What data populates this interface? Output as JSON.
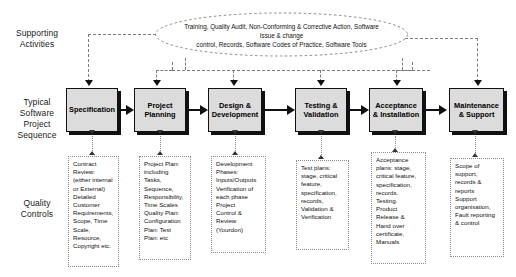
{
  "diagram": {
    "row_labels": [
      {
        "id": "supporting-activities",
        "text": "Supporting\nActivities"
      },
      {
        "id": "typical-software-project-sequence",
        "text": "Typical\nSoftware\nProject\nSequence"
      },
      {
        "id": "quality-controls",
        "text": "Quality\nControls"
      }
    ],
    "supporting_activities": {
      "shape": "ellipse",
      "text": "Training, Quality Audit, Non-Conforming & Corrective Action,  Software Issue & change\ncontrol, Records, Software Codes of Practice, Software Tools"
    },
    "process_steps": [
      {
        "id": "specification",
        "label": "Specification"
      },
      {
        "id": "project-planning",
        "label": "Project\nPlanning"
      },
      {
        "id": "design-development",
        "label": "Design &\nDevelopment"
      },
      {
        "id": "testing-validation",
        "label": "Testing &\nValidation"
      },
      {
        "id": "acceptance-installation",
        "label": "Acceptance\n& Installation"
      },
      {
        "id": "maintenance-support",
        "label": "Maintenance\n& Support"
      }
    ],
    "quality_controls": [
      {
        "id": "qc-specification",
        "text": "Contract\nReview:\n(either internal\nor External)\nDetailed\nCustomer\nRequirements,\nScope, Time\nScale,\nResource,\nCopyright etc."
      },
      {
        "id": "qc-project-planning",
        "text": "Project Plan:\nincluding\nTasks,\nSequence,\nResponsibility,\nTime Scales\nQuality Plan:\nConfiguration\nPlan: Test\nPlan: etc"
      },
      {
        "id": "qc-design-development",
        "text": "Development\nPhases:\nInputs/Outputs\nVerification of\neach phase\nProject\nControl &\nReview\n(Yourdon)"
      },
      {
        "id": "qc-testing-validation",
        "text": "Test plans:\nstage, critical\nfeature,\nspecification,\nrecords,\nValidation &\nVerification"
      },
      {
        "id": "qc-acceptance-installation",
        "text": "Acceptance\nplans: stage,\ncritical feature,\nspecification,\nrecords.\nTesting.\nProduct\nRelease &\nHand over\ncertificate,\nManuals"
      },
      {
        "id": "qc-maintenance-support",
        "text": "Scope of\nsupport,\nrecords &\nreports\nSupport\norganisation,\nFault reporting\n& control"
      }
    ],
    "colors": {
      "box_fill": "#dcdcdc",
      "box_border": "#111111",
      "shadow": "#111111",
      "dashed_connector": "#7d7d7d",
      "text": "#111111"
    }
  }
}
